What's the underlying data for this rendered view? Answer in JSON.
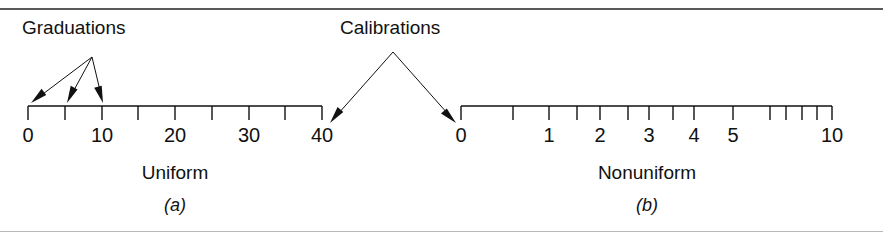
{
  "figure": {
    "background": "#ffffff",
    "ink": "#111111",
    "rule_color": "#5a5a5a"
  },
  "callouts": [
    {
      "id": "graduations",
      "label": "Graduations",
      "label_x": 22,
      "label_y": 18,
      "apex_x": 92,
      "apex_y": 57,
      "targets_x": [
        31,
        67,
        103
      ],
      "targets_y": 103
    },
    {
      "id": "calibrations",
      "label": "Calibrations",
      "label_x": 340,
      "label_y": 18,
      "apex_x": 393,
      "apex_y": 52,
      "targets_x": [
        330,
        456
      ],
      "targets_y": 123
    }
  ],
  "scales": [
    {
      "id": "uniform",
      "name": "Uniform",
      "part_label": "(a)",
      "type": "linear",
      "axis_y": 106,
      "x_start": 28,
      "x_end": 322,
      "tick_length": 14,
      "name_x": 175,
      "name_y": 163,
      "part_label_x": 175,
      "part_label_y": 196,
      "label_y": 125,
      "ticks": [
        {
          "value": 0,
          "x": 28,
          "label": "0"
        },
        {
          "value": 5,
          "x": 65,
          "label": ""
        },
        {
          "value": 10,
          "x": 102,
          "label": "10"
        },
        {
          "value": 15,
          "x": 138,
          "label": ""
        },
        {
          "value": 20,
          "x": 175,
          "label": "20"
        },
        {
          "value": 25,
          "x": 212,
          "label": ""
        },
        {
          "value": 30,
          "x": 249,
          "label": "30"
        },
        {
          "value": 35,
          "x": 285,
          "label": ""
        },
        {
          "value": 40,
          "x": 322,
          "label": "40"
        }
      ]
    },
    {
      "id": "nonuniform",
      "name": "Nonuniform",
      "part_label": "(b)",
      "type": "logarithmic",
      "axis_y": 106,
      "x_start": 461,
      "x_end": 832,
      "tick_length": 14,
      "name_x": 647,
      "name_y": 163,
      "part_label_x": 647,
      "part_label_y": 196,
      "label_y": 125,
      "ticks": [
        {
          "value": 0,
          "x": 461,
          "label": "0"
        },
        {
          "value": 0.5,
          "x": 513,
          "label": ""
        },
        {
          "value": 1,
          "x": 549,
          "label": "1"
        },
        {
          "value": 1.5,
          "x": 577,
          "label": ""
        },
        {
          "value": 2,
          "x": 600,
          "label": "2"
        },
        {
          "value": 2.5,
          "x": 628,
          "label": ""
        },
        {
          "value": 3,
          "x": 649,
          "label": "3"
        },
        {
          "value": 3.5,
          "x": 673,
          "label": ""
        },
        {
          "value": 4,
          "x": 694,
          "label": "4"
        },
        {
          "value": 5,
          "x": 733,
          "label": "5"
        },
        {
          "value": 6,
          "x": 770,
          "label": ""
        },
        {
          "value": 7,
          "x": 786,
          "label": ""
        },
        {
          "value": 8,
          "x": 802,
          "label": ""
        },
        {
          "value": 9,
          "x": 817,
          "label": ""
        },
        {
          "value": 10,
          "x": 832,
          "label": "10"
        }
      ]
    }
  ]
}
